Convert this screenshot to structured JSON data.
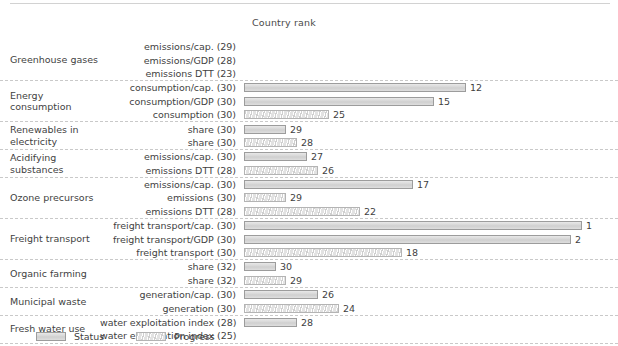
{
  "header": {
    "column_title": "Country rank"
  },
  "legend": {
    "status_label": "Status",
    "progress_label": "Progress",
    "status_icon": "status-swatch-icon",
    "progress_icon": "progress-swatch-icon"
  },
  "colors": {
    "bar_fill": "#d6d6d6",
    "bar_border": "#9c9c9c",
    "progress_fill": "#e2e2e2",
    "separator": "#c9c9c9",
    "text": "#3f3f3f"
  },
  "chart_data": {
    "type": "bar",
    "title": "",
    "xlabel": "Country rank",
    "ylabel": "",
    "orientation": "horizontal",
    "xlim": [
      0,
      32
    ],
    "grid": false,
    "legend": [
      "Status",
      "Progress"
    ],
    "legend_position": "bottom-left",
    "note": "Bar length is inversely proportional to rank: rank 1 is longest. Rows with no value have no bar.",
    "groups": [
      {
        "name": "Greenhouse gases",
        "rows": [
          {
            "label": "emissions/cap. (29)",
            "series": "Status",
            "value": null,
            "total": 29
          },
          {
            "label": "emissions/GDP (28)",
            "series": "Status",
            "value": null,
            "total": 28
          },
          {
            "label": "emissions DTT (23)",
            "series": "Progress",
            "value": null,
            "total": 23
          }
        ]
      },
      {
        "name": "Energy consumption",
        "rows": [
          {
            "label": "consumption/cap. (30)",
            "series": "Status",
            "value": 12,
            "total": 30
          },
          {
            "label": "consumption/GDP (30)",
            "series": "Status",
            "value": 15,
            "total": 30
          },
          {
            "label": "consumption (30)",
            "series": "Progress",
            "value": 25,
            "total": 30
          }
        ]
      },
      {
        "name": "Renewables in electricity",
        "rows": [
          {
            "label": "share (30)",
            "series": "Status",
            "value": 29,
            "total": 30
          },
          {
            "label": "share (30)",
            "series": "Progress",
            "value": 28,
            "total": 30
          }
        ]
      },
      {
        "name": "Acidifying substances",
        "rows": [
          {
            "label": "emissions/cap. (30)",
            "series": "Status",
            "value": 27,
            "total": 30
          },
          {
            "label": "emissions DTT (28)",
            "series": "Progress",
            "value": 26,
            "total": 28
          }
        ]
      },
      {
        "name": "Ozone precursors",
        "rows": [
          {
            "label": "emissions/cap. (30)",
            "series": "Status",
            "value": 17,
            "total": 30
          },
          {
            "label": "emissions (30)",
            "series": "Progress",
            "value": 29,
            "total": 30
          },
          {
            "label": "emissions DTT (28)",
            "series": "Progress",
            "value": 22,
            "total": 28
          }
        ]
      },
      {
        "name": "Freight transport",
        "rows": [
          {
            "label": "freight transport/cap. (30)",
            "series": "Status",
            "value": 1,
            "total": 30
          },
          {
            "label": "freight transport/GDP (30)",
            "series": "Status",
            "value": 2,
            "total": 30
          },
          {
            "label": "freight transport (30)",
            "series": "Progress",
            "value": 18,
            "total": 30
          }
        ]
      },
      {
        "name": "Organic farming",
        "rows": [
          {
            "label": "share (32)",
            "series": "Status",
            "value": 30,
            "total": 32
          },
          {
            "label": "share (32)",
            "series": "Progress",
            "value": 29,
            "total": 32
          }
        ]
      },
      {
        "name": "Municipal waste",
        "rows": [
          {
            "label": "generation/cap. (30)",
            "series": "Status",
            "value": 26,
            "total": 30
          },
          {
            "label": "generation (30)",
            "series": "Progress",
            "value": 24,
            "total": 30
          }
        ]
      },
      {
        "name": "Fresh water use",
        "rows": [
          {
            "label": "water exploitation index (28)",
            "series": "Status",
            "value": 28,
            "total": 28
          },
          {
            "label": "water exploitation index (25)",
            "series": "Progress",
            "value": null,
            "total": 25
          }
        ]
      }
    ]
  }
}
